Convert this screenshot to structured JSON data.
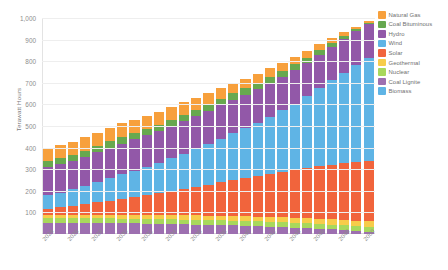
{
  "chart_data": {
    "type": "bar",
    "stacked": true,
    "title": "",
    "subtitle": "",
    "xlabel": "",
    "ylabel": "Terawatt Hours",
    "ylim": [
      0,
      1000
    ],
    "y_ticks": [
      100,
      200,
      300,
      400,
      500,
      600,
      700,
      800,
      900,
      1000
    ],
    "y_tick_labels": [
      "100",
      "200",
      "300",
      "400",
      "500",
      "600",
      "700",
      "800",
      "900",
      "1,000"
    ],
    "grid": true,
    "legend_position": "right",
    "categories": [
      "2024",
      "2025",
      "2026",
      "2027",
      "2028",
      "2029",
      "2030",
      "2031",
      "2032",
      "2033",
      "2034",
      "2035",
      "2036",
      "2037",
      "2038",
      "2039",
      "2040",
      "2041",
      "2042",
      "2043",
      "2044",
      "2045",
      "2046",
      "2047",
      "2048",
      "2049",
      "2050"
    ],
    "x_tick_labels": [
      "2024",
      "",
      "2026",
      "",
      "2028",
      "",
      "2030",
      "",
      "2032",
      "",
      "2034",
      "",
      "2036",
      "",
      "2038",
      "",
      "2040",
      "",
      "2042",
      "",
      "2044",
      "",
      "2046",
      "",
      "2048",
      "",
      "2050"
    ],
    "series": [
      {
        "name": "Coal Lignite",
        "color": "#9d6fb0",
        "values": [
          52,
          52,
          51,
          51,
          50,
          50,
          49,
          49,
          48,
          47,
          46,
          45,
          44,
          43,
          41,
          40,
          38,
          36,
          34,
          32,
          30,
          27,
          24,
          21,
          18,
          14,
          10
        ]
      },
      {
        "name": "Nuclear",
        "color": "#a8d85c",
        "values": [
          22,
          22,
          22,
          22,
          22,
          22,
          22,
          22,
          22,
          22,
          22,
          22,
          22,
          22,
          22,
          22,
          22,
          22,
          22,
          22,
          22,
          22,
          22,
          22,
          22,
          22,
          22
        ]
      },
      {
        "name": "Geothermal",
        "color": "#f7cc4a",
        "values": [
          14,
          14,
          15,
          15,
          16,
          16,
          17,
          17,
          18,
          18,
          19,
          19,
          20,
          20,
          21,
          21,
          22,
          22,
          23,
          23,
          24,
          24,
          25,
          25,
          26,
          26,
          27
        ]
      },
      {
        "name": "Solar",
        "color": "#f1643c",
        "values": [
          30,
          36,
          43,
          50,
          58,
          66,
          75,
          84,
          93,
          103,
          113,
          123,
          133,
          144,
          155,
          166,
          177,
          188,
          199,
          210,
          221,
          232,
          243,
          253,
          263,
          272,
          280
        ]
      },
      {
        "name": "Wind",
        "color": "#5fb4e5"
      },
      {
        "name": "Hydro",
        "color": "#9258a8"
      },
      {
        "name": "Coal Bituminous",
        "color": "#67a84f"
      },
      {
        "name": "Natural Gas",
        "color": "#f7a03c"
      },
      {
        "name": "Biomass",
        "color": "#5fb4e5"
      }
    ],
    "legend_entries": [
      {
        "label": "Natural Gas",
        "color": "#f7a03c"
      },
      {
        "label": "Coal Bituminous",
        "color": "#67a84f"
      },
      {
        "label": "Hydro",
        "color": "#9258a8"
      },
      {
        "label": "Wind",
        "color": "#5fb4e5"
      },
      {
        "label": "Solar",
        "color": "#f1643c"
      },
      {
        "label": "Geothermal",
        "color": "#f7cc4a"
      },
      {
        "label": "Nuclear",
        "color": "#a8d85c"
      },
      {
        "label": "Coal Lignite",
        "color": "#9d6fb0"
      },
      {
        "label": "Biomass",
        "color": "#5fb4e5"
      }
    ],
    "stack_order_bottom_to_top": [
      "Coal Lignite",
      "Nuclear",
      "Geothermal",
      "Solar",
      "Wind",
      "Hydro",
      "Coal Bituminous",
      "Natural Gas"
    ],
    "stacks": [
      {
        "category": "2024",
        "total": 400,
        "values": {
          "Coal Lignite": 52,
          "Nuclear": 22,
          "Geothermal": 14,
          "Solar": 30,
          "Wind": 62,
          "Hydro": 130,
          "Coal Bituminous": 28,
          "Natural Gas": 62
        }
      },
      {
        "category": "2025",
        "total": 412,
        "values": {
          "Coal Lignite": 52,
          "Nuclear": 22,
          "Geothermal": 14,
          "Solar": 36,
          "Wind": 68,
          "Hydro": 130,
          "Coal Bituminous": 28,
          "Natural Gas": 62
        }
      },
      {
        "category": "2026",
        "total": 428,
        "values": {
          "Coal Lignite": 51,
          "Nuclear": 22,
          "Geothermal": 15,
          "Solar": 43,
          "Wind": 76,
          "Hydro": 131,
          "Coal Bituminous": 28,
          "Natural Gas": 62
        }
      },
      {
        "category": "2027",
        "total": 448,
        "values": {
          "Coal Lignite": 51,
          "Nuclear": 22,
          "Geothermal": 15,
          "Solar": 50,
          "Wind": 86,
          "Hydro": 133,
          "Coal Bituminous": 29,
          "Natural Gas": 62
        }
      },
      {
        "category": "2028",
        "total": 470,
        "values": {
          "Coal Lignite": 50,
          "Nuclear": 22,
          "Geothermal": 16,
          "Solar": 58,
          "Wind": 96,
          "Hydro": 136,
          "Coal Bituminous": 30,
          "Natural Gas": 62
        }
      },
      {
        "category": "2029",
        "total": 492,
        "values": {
          "Coal Lignite": 50,
          "Nuclear": 22,
          "Geothermal": 16,
          "Solar": 66,
          "Wind": 106,
          "Hydro": 139,
          "Coal Bituminous": 31,
          "Natural Gas": 62
        }
      },
      {
        "category": "2030",
        "total": 512,
        "values": {
          "Coal Lignite": 49,
          "Nuclear": 22,
          "Geothermal": 17,
          "Solar": 75,
          "Wind": 114,
          "Hydro": 142,
          "Coal Bituminous": 31,
          "Natural Gas": 62
        }
      },
      {
        "category": "2031",
        "total": 530,
        "values": {
          "Coal Lignite": 49,
          "Nuclear": 22,
          "Geothermal": 17,
          "Solar": 84,
          "Wind": 122,
          "Hydro": 144,
          "Coal Bituminous": 31,
          "Natural Gas": 61
        }
      },
      {
        "category": "2032",
        "total": 548,
        "values": {
          "Coal Lignite": 48,
          "Nuclear": 22,
          "Geothermal": 18,
          "Solar": 93,
          "Wind": 130,
          "Hydro": 146,
          "Coal Bituminous": 31,
          "Natural Gas": 60
        }
      },
      {
        "category": "2033",
        "total": 566,
        "values": {
          "Coal Lignite": 47,
          "Nuclear": 22,
          "Geothermal": 18,
          "Solar": 103,
          "Wind": 139,
          "Hydro": 148,
          "Coal Bituminous": 30,
          "Natural Gas": 59
        }
      },
      {
        "category": "2034",
        "total": 588,
        "values": {
          "Coal Lignite": 46,
          "Nuclear": 22,
          "Geothermal": 19,
          "Solar": 113,
          "Wind": 150,
          "Hydro": 150,
          "Coal Bituminous": 30,
          "Natural Gas": 58
        }
      },
      {
        "category": "2035",
        "total": 610,
        "values": {
          "Coal Lignite": 45,
          "Nuclear": 22,
          "Geothermal": 19,
          "Solar": 123,
          "Wind": 162,
          "Hydro": 152,
          "Coal Bituminous": 30,
          "Natural Gas": 57
        }
      },
      {
        "category": "2036",
        "total": 630,
        "values": {
          "Coal Lignite": 44,
          "Nuclear": 22,
          "Geothermal": 20,
          "Solar": 133,
          "Wind": 174,
          "Hydro": 153,
          "Coal Bituminous": 29,
          "Natural Gas": 55
        }
      },
      {
        "category": "2037",
        "total": 652,
        "values": {
          "Coal Lignite": 43,
          "Nuclear": 22,
          "Geothermal": 20,
          "Solar": 144,
          "Wind": 187,
          "Hydro": 154,
          "Coal Bituminous": 29,
          "Natural Gas": 53
        }
      },
      {
        "category": "2038",
        "total": 678,
        "values": {
          "Coal Lignite": 41,
          "Nuclear": 22,
          "Geothermal": 21,
          "Solar": 155,
          "Wind": 203,
          "Hydro": 155,
          "Coal Bituminous": 30,
          "Natural Gas": 51
        }
      },
      {
        "category": "2039",
        "total": 700,
        "values": {
          "Coal Lignite": 40,
          "Nuclear": 22,
          "Geothermal": 21,
          "Solar": 166,
          "Wind": 217,
          "Hydro": 156,
          "Coal Bituminous": 29,
          "Natural Gas": 49
        }
      },
      {
        "category": "2040",
        "total": 720,
        "values": {
          "Coal Lignite": 38,
          "Nuclear": 22,
          "Geothermal": 22,
          "Solar": 177,
          "Wind": 231,
          "Hydro": 156,
          "Coal Bituminous": 28,
          "Natural Gas": 46
        }
      },
      {
        "category": "2041",
        "total": 742,
        "values": {
          "Coal Lignite": 36,
          "Nuclear": 22,
          "Geothermal": 22,
          "Solar": 188,
          "Wind": 247,
          "Hydro": 157,
          "Coal Bituminous": 27,
          "Natural Gas": 43
        }
      },
      {
        "category": "2042",
        "total": 768,
        "values": {
          "Coal Lignite": 34,
          "Nuclear": 22,
          "Geothermal": 23,
          "Solar": 199,
          "Wind": 266,
          "Hydro": 157,
          "Coal Bituminous": 27,
          "Natural Gas": 40
        }
      },
      {
        "category": "2043",
        "total": 792,
        "values": {
          "Coal Lignite": 32,
          "Nuclear": 22,
          "Geothermal": 23,
          "Solar": 210,
          "Wind": 285,
          "Hydro": 157,
          "Coal Bituminous": 26,
          "Natural Gas": 37
        }
      },
      {
        "category": "2044",
        "total": 820,
        "values": {
          "Coal Lignite": 30,
          "Nuclear": 22,
          "Geothermal": 24,
          "Solar": 221,
          "Wind": 307,
          "Hydro": 157,
          "Coal Bituminous": 25,
          "Natural Gas": 34
        }
      },
      {
        "category": "2045",
        "total": 848,
        "values": {
          "Coal Lignite": 27,
          "Nuclear": 22,
          "Geothermal": 24,
          "Solar": 232,
          "Wind": 332,
          "Hydro": 157,
          "Coal Bituminous": 23,
          "Natural Gas": 31
        }
      },
      {
        "category": "2046",
        "total": 878,
        "values": {
          "Coal Lignite": 24,
          "Nuclear": 22,
          "Geothermal": 25,
          "Solar": 243,
          "Wind": 360,
          "Hydro": 157,
          "Coal Bituminous": 20,
          "Natural Gas": 27
        }
      },
      {
        "category": "2047",
        "total": 908,
        "values": {
          "Coal Lignite": 21,
          "Nuclear": 22,
          "Geothermal": 25,
          "Solar": 253,
          "Wind": 390,
          "Hydro": 157,
          "Coal Bituminous": 17,
          "Natural Gas": 23
        }
      },
      {
        "category": "2048",
        "total": 935,
        "values": {
          "Coal Lignite": 18,
          "Nuclear": 22,
          "Geothermal": 26,
          "Solar": 263,
          "Wind": 418,
          "Hydro": 157,
          "Coal Bituminous": 13,
          "Natural Gas": 18
        }
      },
      {
        "category": "2049",
        "total": 960,
        "values": {
          "Coal Lignite": 14,
          "Nuclear": 22,
          "Geothermal": 26,
          "Solar": 272,
          "Wind": 447,
          "Hydro": 157,
          "Coal Bituminous": 9,
          "Natural Gas": 13
        }
      },
      {
        "category": "2050",
        "total": 985,
        "values": {
          "Coal Lignite": 10,
          "Nuclear": 22,
          "Geothermal": 27,
          "Solar": 280,
          "Wind": 477,
          "Hydro": 157,
          "Coal Bituminous": 5,
          "Natural Gas": 7
        }
      }
    ]
  }
}
